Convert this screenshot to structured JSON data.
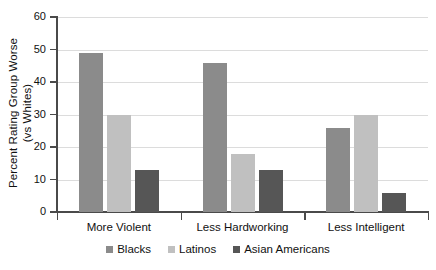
{
  "chart_data": {
    "type": "bar",
    "title": "",
    "xlabel": "",
    "ylabel": "Percent Rating Group Worse (vs Whites)",
    "ylabel_line1": "Percent Rating Group Worse",
    "ylabel_line2": "(vs Whites)",
    "categories": [
      "More Violent",
      "Less Hardworking",
      "Less Intelligent"
    ],
    "series": [
      {
        "name": "Blacks",
        "color": "#8b8b8b",
        "values": [
          49,
          46,
          26
        ]
      },
      {
        "name": "Latinos",
        "color": "#c0c0c0",
        "values": [
          30,
          18,
          30
        ]
      },
      {
        "name": "Asian Americans",
        "color": "#565656",
        "values": [
          13,
          13,
          6
        ]
      }
    ],
    "ylim": [
      0,
      60
    ],
    "ytick_labels": [
      "0",
      "10",
      "20",
      "30",
      "40",
      "50",
      "60"
    ],
    "ytick_values": [
      0,
      10,
      20,
      30,
      40,
      50,
      60
    ],
    "grid": true,
    "grid_axis": "y",
    "legend_position": "bottom",
    "background_color": "#ffffff",
    "axis_color": "#4a4a4a",
    "gridline_color": "#dcdcdc"
  }
}
